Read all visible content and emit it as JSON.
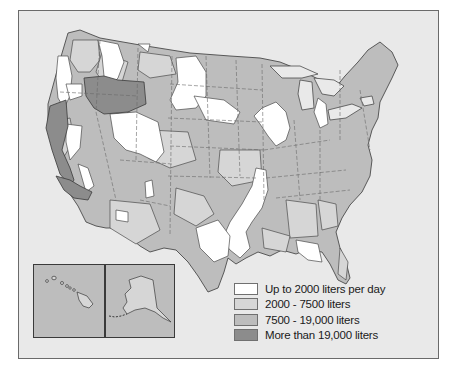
{
  "map": {
    "subject": "United States water use per day by region",
    "insets": [
      {
        "name": "Hawaii"
      },
      {
        "name": "Alaska"
      }
    ],
    "colors": {
      "background": "#e9e9e9",
      "frame_border": "#6a6a6a",
      "region_border": "#4a4a4a",
      "state_border_dashed": "#6a6a6a"
    }
  },
  "legend": {
    "items": [
      {
        "label": "Up to 2000 liters per day",
        "color": "#ffffff"
      },
      {
        "label": "2000 - 7500 liters",
        "color": "#d6d6d6"
      },
      {
        "label": "7500 - 19,000 liters",
        "color": "#bdbdbd"
      },
      {
        "label": "More than 19,000 liters",
        "color": "#8c8c8c"
      }
    ]
  }
}
